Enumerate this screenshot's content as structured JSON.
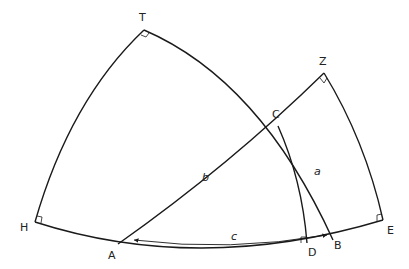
{
  "diagram": {
    "points": {
      "T": "T",
      "Z": "Z",
      "C": "C",
      "H": "H",
      "A": "A",
      "D": "D",
      "B": "B",
      "E": "E"
    },
    "sides": {
      "a": "a",
      "b": "b",
      "c": "c"
    },
    "right_angle_markers": [
      "T",
      "Z",
      "H",
      "D",
      "E"
    ],
    "colors": {
      "stroke": "#1a1a1a",
      "background": "#ffffff"
    }
  }
}
